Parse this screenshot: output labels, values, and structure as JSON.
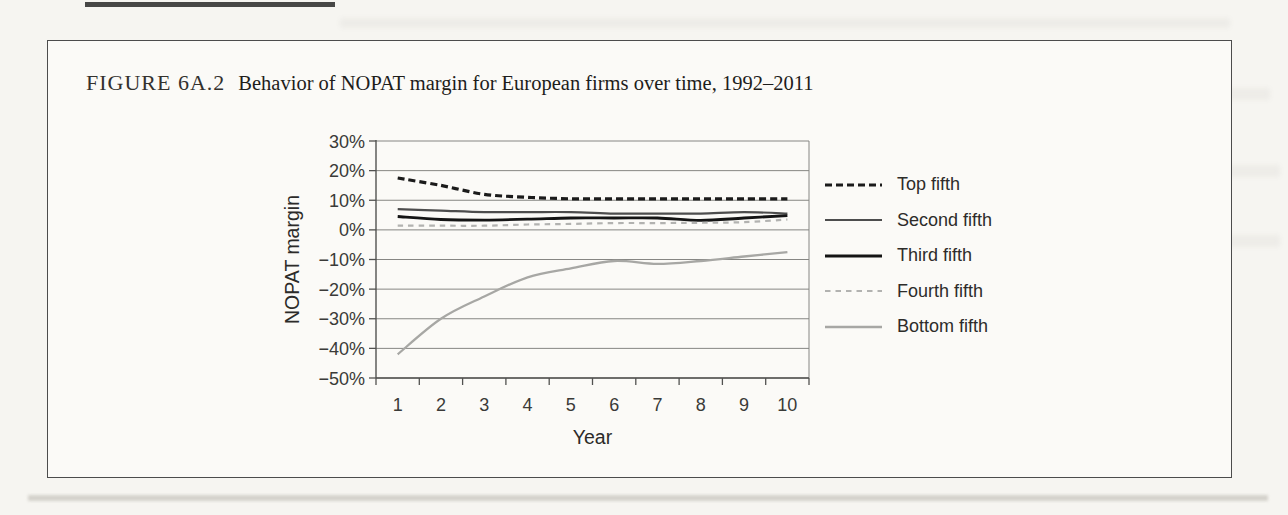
{
  "figure": {
    "label": "FIGURE 6A.2",
    "caption": "Behavior of NOPAT margin for European firms over time, 1992–2011"
  },
  "colors": {
    "page_bg": "#f6f5f1",
    "box_bg": "#fbfaf7",
    "box_border": "#4c4c4c",
    "grid": "#868683",
    "axis": "#525250",
    "tick_text": "#3a3a38"
  },
  "chart_data": {
    "type": "line",
    "title": "Behavior of NOPAT margin for European firms over time, 1992–2011",
    "xlabel": "Year",
    "ylabel": "NOPAT margin",
    "categories": [
      "1",
      "2",
      "3",
      "4",
      "5",
      "6",
      "7",
      "8",
      "9",
      "10"
    ],
    "ylim": [
      -50,
      30
    ],
    "yticks": [
      30,
      20,
      10,
      0,
      -10,
      -20,
      -30,
      -40,
      -50
    ],
    "ytick_format": "percent",
    "grid": true,
    "legend_position": "right",
    "series": [
      {
        "name": "Top fifth",
        "values": [
          17.5,
          15,
          12,
          11,
          10.5,
          10.5,
          10.5,
          10.5,
          10.5,
          10.5
        ],
        "color": "#1b1b1b",
        "dash": "7 4",
        "width": 3.2
      },
      {
        "name": "Second fifth",
        "values": [
          7,
          6.5,
          6,
          6,
          6,
          5.5,
          5.5,
          5.5,
          6,
          5.5
        ],
        "color": "#4d4d4d",
        "dash": "",
        "width": 2.2
      },
      {
        "name": "Third fifth",
        "values": [
          4.5,
          3.5,
          3.3,
          3.6,
          4,
          4,
          4,
          3.2,
          4,
          4.8
        ],
        "color": "#141414",
        "dash": "",
        "width": 2.8
      },
      {
        "name": "Fourth fifth",
        "values": [
          1.4,
          1.4,
          1.4,
          1.8,
          2,
          2.3,
          2.3,
          2.4,
          2.6,
          3.5
        ],
        "color": "#b2b2b0",
        "dash": "5.5 5",
        "width": 2.2
      },
      {
        "name": "Bottom fifth",
        "values": [
          -42,
          -30,
          -22.5,
          -16,
          -13,
          -10.5,
          -11.5,
          -10.5,
          -9,
          -7.5
        ],
        "color": "#a7a7a4",
        "dash": "",
        "width": 2.3
      }
    ]
  }
}
